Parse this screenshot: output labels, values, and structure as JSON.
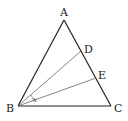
{
  "diagram": {
    "type": "geometry-triangle",
    "colors": {
      "background": "#ffffff",
      "outline": "#222222",
      "inner_lines": "#666666",
      "text": "#222222"
    },
    "points": {
      "A": {
        "label": "A",
        "x": 64,
        "y": 20
      },
      "B": {
        "label": "B",
        "x": 18,
        "y": 106
      },
      "C": {
        "label": "C",
        "x": 111,
        "y": 106
      },
      "D": {
        "label": "D",
        "x": 81,
        "y": 51
      },
      "E": {
        "label": "E",
        "x": 96,
        "y": 78
      }
    },
    "segments": [
      {
        "from": "A",
        "to": "B",
        "style": "outline"
      },
      {
        "from": "A",
        "to": "C",
        "style": "outline"
      },
      {
        "from": "B",
        "to": "C",
        "style": "outline"
      },
      {
        "from": "B",
        "to": "D",
        "style": "inner"
      },
      {
        "from": "B",
        "to": "E",
        "style": "inner"
      }
    ],
    "angle_mark": {
      "label": "x",
      "vertex": "B",
      "between": [
        "D",
        "E"
      ]
    }
  }
}
